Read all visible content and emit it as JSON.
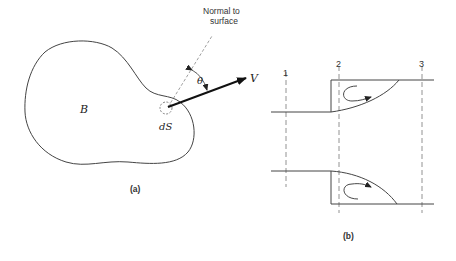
{
  "figure_a": {
    "body_label": "B",
    "element_label": "dS",
    "normal_label_line1": "Normal to",
    "normal_label_line2": "surface",
    "angle_label": "θ",
    "velocity_label": "V",
    "caption": "(a)"
  },
  "figure_b": {
    "section_labels": [
      "1",
      "2",
      "3"
    ],
    "caption": "(b)"
  },
  "colors": {
    "stroke": "#333333",
    "dashed": "#777777"
  }
}
